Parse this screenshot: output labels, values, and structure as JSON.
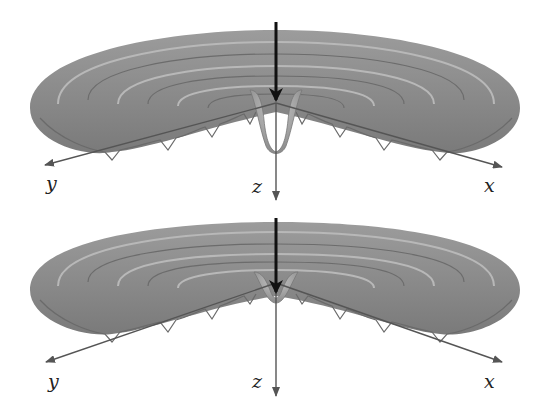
{
  "figure": {
    "panels": [
      {
        "id": "top",
        "description": "ripple surface with deep central dip",
        "axes": {
          "x": "x",
          "y": "y",
          "z": "z"
        },
        "center_dip": "deep"
      },
      {
        "id": "bottom",
        "description": "ripple surface with shallow central dip",
        "axes": {
          "x": "x",
          "y": "y",
          "z": "z"
        },
        "center_dip": "shallow"
      }
    ],
    "colors": {
      "surface": "#8a8a8a",
      "surface_light": "#b5b5b5",
      "surface_dark": "#6e6e6e",
      "axis": "#555555",
      "force_arrow": "#111111"
    }
  }
}
